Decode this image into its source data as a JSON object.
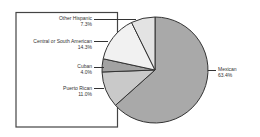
{
  "chart_data": {
    "type": "pie",
    "title": "",
    "start_angle_deg": 0,
    "direction": "clockwise",
    "categories": [
      "Mexican",
      "Puerto Rican",
      "Cuban",
      "Central or South American",
      "Other Hispanic"
    ],
    "values": [
      63.4,
      11.0,
      4.0,
      14.3,
      7.3
    ],
    "value_labels": [
      "63.4%",
      "11.0%",
      "4.0%",
      "14.3%",
      "7.3%"
    ],
    "colors": [
      "#a9a9a9",
      "#c9c9c9",
      "#a2a2a2",
      "#f1f1f1",
      "#e3e3e3"
    ],
    "legend_position": "callout-labels"
  },
  "labels": {
    "mexican": {
      "name": "Mexican",
      "value": "63.4%"
    },
    "puerto_rican": {
      "name": "Puerto Rican",
      "value": "11.0%"
    },
    "cuban": {
      "name": "Cuban",
      "value": "4.0%"
    },
    "central_south": {
      "name": "Central or South American",
      "value": "14.3%"
    },
    "other": {
      "name": "Other Hispanic",
      "value": "7.3%"
    }
  }
}
